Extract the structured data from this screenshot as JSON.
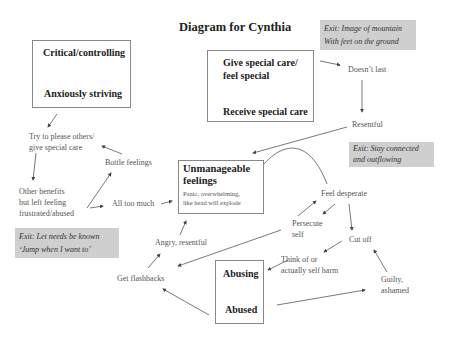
{
  "title": "Diagram for Cynthia",
  "boxes": {
    "critical": {
      "top": "Critical/controlling",
      "bottom": "Anxiously striving"
    },
    "special": {
      "top_line1": "Give special care/",
      "top_line2": "feel special",
      "bottom": "Receive special care"
    },
    "unmanageable": {
      "line1": "Unmanageable",
      "line2": "feelings",
      "sub1": "Panic, overwhelming,",
      "sub2": "like head will explode"
    },
    "abusing": {
      "top": "Abusing",
      "bottom": "Abused"
    }
  },
  "exits": {
    "mountain": {
      "line1": "Exit: Image of mountain",
      "line2": "With feet on the ground"
    },
    "connected": {
      "line1": "Exit: Stay connected",
      "line2": "and outflowing"
    },
    "needs": {
      "line1": "Exit: Let needs be known",
      "line2": "‘Jump when I want to’"
    }
  },
  "nodes": {
    "try_please_1": "Try to please others/",
    "try_please_2": "give special care",
    "bottle": "Bottle feelings",
    "other_benefits_1": "Other benefits",
    "other_benefits_2": "but left feeling",
    "other_benefits_3": "frustrated/abused",
    "all_too_much": "All too much",
    "doesnt_last": "Doesn’t last",
    "resentful": "Resentful",
    "feel_desperate": "Feel desperate",
    "persecute_1": "Persecute",
    "persecute_2": "self",
    "cut_off": "Cut off",
    "think_1": "Think of or",
    "think_2": "actually self harm",
    "guilty_1": "Guilty,",
    "guilty_2": "ashamed",
    "angry": "Angry, resentful",
    "flashbacks": "Get flashbacks"
  }
}
